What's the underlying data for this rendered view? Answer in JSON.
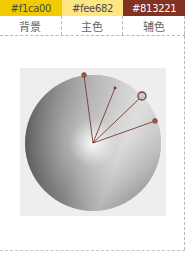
{
  "swatches": [
    {
      "hex": "#f1ca00",
      "label": "背景",
      "text_color": "#4a4a4a"
    },
    {
      "hex": "#fee682",
      "label": "主色",
      "text_color": "#4a4a4a"
    },
    {
      "hex": "#813221",
      "label": "辅色",
      "text_color": "#ffffff"
    }
  ],
  "wheel": {
    "center": [
      73,
      75
    ],
    "radius": 68,
    "handles": [
      {
        "x": 64,
        "y": 7,
        "type": "dot"
      },
      {
        "x": 95,
        "y": 20,
        "type": "small-dot"
      },
      {
        "x": 122,
        "y": 28,
        "type": "selected-ring"
      },
      {
        "x": 135,
        "y": 53,
        "type": "dot"
      }
    ],
    "line_color": "#7a3a2c"
  }
}
